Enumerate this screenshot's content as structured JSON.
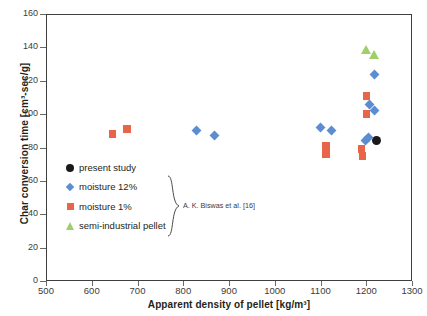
{
  "chart_data": {
    "type": "scatter",
    "title": "",
    "xlabel": "Apparent density of pellet [kg/m³]",
    "ylabel": "Char conversion time [cm³-sec/g]",
    "xlim": [
      500,
      1300
    ],
    "ylim": [
      0,
      160
    ],
    "xticks": [
      500,
      600,
      700,
      800,
      900,
      1000,
      1100,
      1200,
      1300
    ],
    "yticks": [
      0,
      20,
      40,
      60,
      80,
      100,
      120,
      140,
      160
    ],
    "grid": false,
    "legend_position": "inside-left",
    "series": [
      {
        "name": "present study",
        "marker": "circle",
        "color": "#1a1a1a",
        "points": [
          {
            "x": 1222,
            "y": 84
          }
        ]
      },
      {
        "name": "moisture 12%",
        "marker": "diamond",
        "color": "#5b8dd0",
        "points": [
          {
            "x": 828,
            "y": 90
          },
          {
            "x": 868,
            "y": 87
          },
          {
            "x": 1100,
            "y": 92
          },
          {
            "x": 1124,
            "y": 90
          },
          {
            "x": 1198,
            "y": 84
          },
          {
            "x": 1204,
            "y": 86
          },
          {
            "x": 1217,
            "y": 102
          },
          {
            "x": 1217,
            "y": 124
          },
          {
            "x": 1207,
            "y": 106
          }
        ]
      },
      {
        "name": "moisture 1%",
        "marker": "square",
        "color": "#e8654a",
        "points": [
          {
            "x": 645,
            "y": 88
          },
          {
            "x": 677,
            "y": 91
          },
          {
            "x": 1112,
            "y": 81
          },
          {
            "x": 1112,
            "y": 76
          },
          {
            "x": 1190,
            "y": 79
          },
          {
            "x": 1192,
            "y": 75
          },
          {
            "x": 1200,
            "y": 111
          },
          {
            "x": 1200,
            "y": 100
          }
        ]
      },
      {
        "name": "semi-industrial pellet",
        "marker": "triangle",
        "color": "#9fcf6a",
        "points": [
          {
            "x": 1200,
            "y": 139
          },
          {
            "x": 1217,
            "y": 136
          }
        ]
      }
    ],
    "annotations": [
      {
        "text": "A. K. Biswas et al. [16]",
        "target": "moisture 12% / moisture 1% / semi-industrial pellet",
        "style": "brace"
      }
    ]
  },
  "legend": {
    "items": [
      {
        "label": "present study",
        "marker": "circle",
        "color": "#1a1a1a"
      },
      {
        "label": "moisture 12%",
        "marker": "diamond",
        "color": "#5b8dd0"
      },
      {
        "label": "moisture 1%",
        "marker": "square",
        "color": "#e8654a"
      },
      {
        "label": "semi-industrial pellet",
        "marker": "triangle",
        "color": "#9fcf6a"
      }
    ],
    "brace_note": "A. K. Biswas et al. [16]"
  }
}
